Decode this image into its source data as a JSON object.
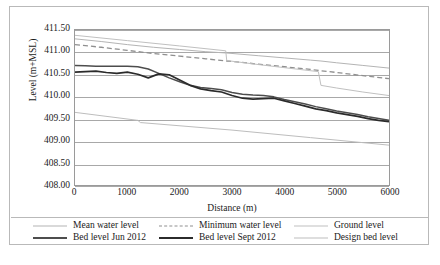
{
  "chart_data": {
    "type": "line",
    "title": "",
    "xlabel": "Distance (m)",
    "ylabel": "Level (m+MSL)",
    "xlim": [
      0,
      6000
    ],
    "ylim": [
      408.0,
      411.5
    ],
    "grid": "horizontal",
    "legend_position": "bottom",
    "xticks": [
      "0",
      "1000",
      "2000",
      "3000",
      "4000",
      "5000",
      "6000"
    ],
    "xtick_values": [
      0,
      1000,
      2000,
      3000,
      4000,
      5000,
      6000
    ],
    "yticks": [
      "408.00",
      "408.50",
      "409.00",
      "409.50",
      "410.00",
      "410.50",
      "411.00",
      "411.50"
    ],
    "ytick_values": [
      408.0,
      408.5,
      409.0,
      409.5,
      410.0,
      410.5,
      411.0,
      411.5
    ],
    "series": [
      {
        "name": "Mean water level",
        "color": "#b4b4b4",
        "width": 1.0,
        "dash": "none",
        "x": [
          0,
          500,
          1000,
          1500,
          2000,
          2500,
          2900,
          3000,
          3500,
          4000,
          4500,
          4700,
          5000,
          5500,
          6000
        ],
        "values": [
          411.3,
          411.24,
          411.17,
          411.11,
          411.06,
          411.01,
          410.98,
          410.97,
          410.92,
          410.87,
          410.82,
          410.8,
          410.76,
          410.7,
          410.64
        ]
      },
      {
        "name": "Minimum water level",
        "color": "#8f8f8f",
        "width": 1.3,
        "dash": "5,3",
        "x": [
          0,
          500,
          1000,
          1500,
          2000,
          2500,
          2900,
          3000,
          3500,
          4000,
          4500,
          4700,
          5000,
          5500,
          6000
        ],
        "values": [
          411.17,
          411.11,
          411.04,
          410.97,
          410.91,
          410.85,
          410.8,
          410.79,
          410.73,
          410.67,
          410.61,
          410.58,
          410.54,
          410.47,
          410.4
        ]
      },
      {
        "name": "Ground level",
        "color": "#c0c0c0",
        "width": 1.0,
        "dash": "none",
        "x": [
          0,
          1000,
          2000,
          2880,
          2900,
          3500,
          4000,
          4650,
          4700,
          5000,
          5500,
          6000
        ],
        "values": [
          411.38,
          411.26,
          411.14,
          411.03,
          410.81,
          410.72,
          410.65,
          410.56,
          410.25,
          410.19,
          410.1,
          410.02
        ]
      },
      {
        "name": "Bed level Jun 2012",
        "color": "#4d4d4d",
        "width": 1.5,
        "dash": "none",
        "x": [
          0,
          200,
          400,
          600,
          800,
          1000,
          1200,
          1400,
          1600,
          1800,
          2000,
          2200,
          2400,
          2600,
          2800,
          3000,
          3200,
          3400,
          3600,
          3800,
          4000,
          4200,
          4400,
          4600,
          4800,
          5000,
          5200,
          5400,
          5600,
          5800,
          6000
        ],
        "values": [
          410.7,
          410.69,
          410.68,
          410.68,
          410.68,
          410.68,
          410.67,
          410.62,
          410.52,
          410.42,
          410.33,
          410.25,
          410.2,
          410.18,
          410.15,
          410.09,
          410.05,
          410.03,
          410.02,
          409.99,
          409.93,
          409.88,
          409.83,
          409.77,
          409.72,
          409.67,
          409.63,
          409.59,
          409.54,
          409.5,
          409.46
        ]
      },
      {
        "name": "Bed level Sept 2012",
        "color": "#2b2b2b",
        "width": 1.7,
        "dash": "none",
        "x": [
          0,
          200,
          400,
          600,
          800,
          1000,
          1200,
          1400,
          1600,
          1800,
          2000,
          2200,
          2400,
          2600,
          2800,
          3000,
          3200,
          3400,
          3600,
          3800,
          4000,
          4200,
          4400,
          4600,
          4800,
          5000,
          5200,
          5400,
          5600,
          5800,
          6000
        ],
        "values": [
          410.55,
          410.56,
          410.57,
          410.54,
          410.52,
          410.55,
          410.5,
          410.42,
          410.51,
          410.49,
          410.37,
          410.25,
          410.17,
          410.13,
          410.1,
          410.02,
          409.96,
          409.94,
          409.95,
          409.96,
          409.9,
          409.84,
          409.78,
          409.72,
          409.68,
          409.63,
          409.59,
          409.55,
          409.5,
          409.46,
          409.43
        ]
      },
      {
        "name": "Design bed level",
        "color": "#bdbdbd",
        "width": 1.0,
        "dash": "none",
        "x": [
          0,
          1200,
          1250,
          3000,
          4500,
          6000
        ],
        "values": [
          409.64,
          409.46,
          409.41,
          409.24,
          409.07,
          408.9
        ]
      }
    ]
  },
  "legend": {
    "rows": [
      [
        {
          "label": "Mean water level",
          "series": "Mean water level"
        },
        {
          "label": "Minimum water level",
          "series": "Minimum water level"
        },
        {
          "label": "Ground level",
          "series": "Ground level"
        }
      ],
      [
        {
          "label": "Bed level Jun 2012",
          "series": "Bed level Jun 2012"
        },
        {
          "label": "Bed level Sept 2012",
          "series": "Bed level Sept 2012"
        },
        {
          "label": "Design bed level",
          "series": "Design bed level"
        }
      ]
    ]
  }
}
